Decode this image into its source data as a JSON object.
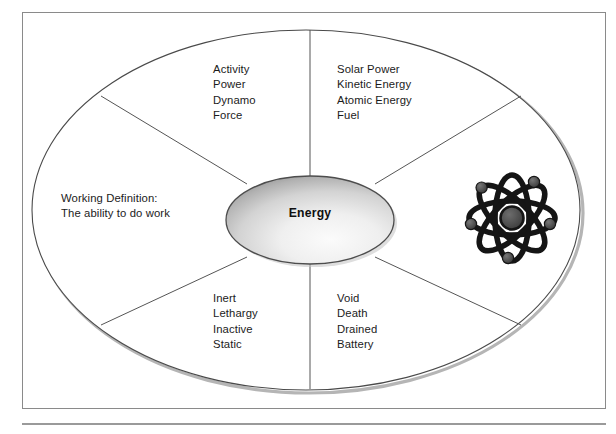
{
  "figure": {
    "center": {
      "label": "Energy",
      "shape": "ellipse"
    },
    "definition": {
      "heading": "Working Definition:",
      "text": "The ability to do work"
    },
    "quadrants": [
      {
        "id": "top-left",
        "position": "upper-left",
        "items": [
          "Activity",
          "Power",
          "Dynamo",
          "Force"
        ]
      },
      {
        "id": "top-right",
        "position": "upper-right",
        "items": [
          "Solar Power",
          "Kinetic Energy",
          "Atomic Energy",
          "Fuel"
        ]
      },
      {
        "id": "bottom-left",
        "position": "lower-left",
        "items": [
          "Inert",
          "Lethargy",
          "Inactive",
          "Static"
        ]
      },
      {
        "id": "bottom-right",
        "position": "lower-right",
        "items": [
          "Void",
          "Death",
          "Drained",
          "Battery"
        ]
      }
    ],
    "icons": [
      {
        "name": "atom-icon",
        "description": "atom with four orbital rings, electrons and nucleus",
        "region": "right"
      }
    ],
    "colors": {
      "frame_border": "#8a8a8a",
      "outer_ellipse_stroke": "#4a4a4a",
      "divider_stroke": "#555555",
      "center_fill_light": "#f2f2f2",
      "center_fill_dark": "#9a9a9a",
      "center_stroke": "#4d4d4d",
      "atom_stroke": "#151515",
      "atom_nucleus": "#4d4d4d",
      "electron": "#4d4d4d",
      "shadow": "#b5b5b5",
      "text": "#1b1b1b",
      "bottom_rule": "#9a9a9a"
    }
  }
}
